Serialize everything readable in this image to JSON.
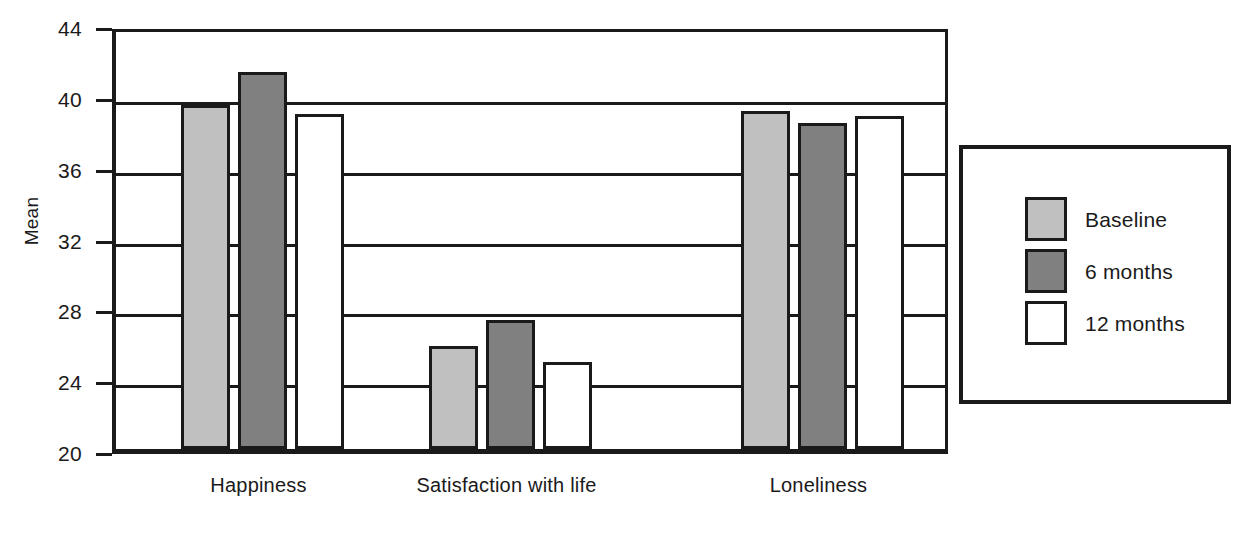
{
  "chart_data": {
    "type": "bar",
    "title": "",
    "xlabel": "",
    "ylabel": "Mean",
    "ylim": [
      20,
      44
    ],
    "yticks": [
      20,
      24,
      28,
      32,
      36,
      40,
      44
    ],
    "grid": true,
    "legend_position": "right",
    "categories": [
      "Happiness",
      "Satisfaction with life",
      "Loneliness"
    ],
    "series": [
      {
        "name": "Baseline",
        "color": "#c0c0c0",
        "values": [
          39.4,
          25.8,
          39.1
        ]
      },
      {
        "name": "6 months",
        "color": "#808080",
        "values": [
          41.3,
          27.3,
          38.4
        ]
      },
      {
        "name": "12 months",
        "color": "#ffffff",
        "values": [
          38.9,
          24.9,
          38.8
        ]
      }
    ]
  },
  "axis": {
    "y_title": "Mean",
    "y_tick_labels": [
      "44",
      "40",
      "36",
      "32",
      "28",
      "24",
      "20"
    ],
    "x_tick_labels": [
      "Happiness",
      "Satisfaction with life",
      "Loneliness"
    ]
  },
  "legend": {
    "items": [
      {
        "label": "Baseline"
      },
      {
        "label": "6 months"
      },
      {
        "label": "12 months"
      }
    ]
  },
  "colors": {
    "baseline": "#c0c0c0",
    "six_months": "#808080",
    "twelve_months": "#ffffff",
    "outline": "#1a1a1a",
    "background": "#ffffff"
  }
}
